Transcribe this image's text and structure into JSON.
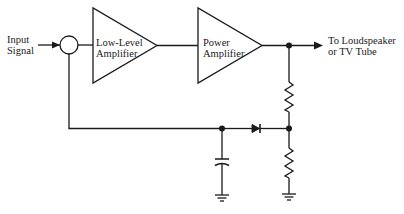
{
  "diagram": {
    "type": "block-schematic",
    "stroke_color": "#1a1a1a",
    "background": "#ffffff",
    "labels": {
      "input_line1": "Input",
      "input_line2": "Signal",
      "low_level_line1": "Low-Level",
      "low_level_line2": "Amplifier",
      "power_line1": "Power",
      "power_line2": "Amplifier",
      "output_line1": "To Loudspeaker",
      "output_line2": "or TV Tube"
    },
    "blocks": [
      {
        "id": "summing-junction",
        "shape": "circle"
      },
      {
        "id": "low-level-amplifier",
        "shape": "triangle",
        "label": "Low-Level Amplifier"
      },
      {
        "id": "power-amplifier",
        "shape": "triangle",
        "label": "Power Amplifier"
      },
      {
        "id": "resistor-upper",
        "shape": "resistor"
      },
      {
        "id": "resistor-lower",
        "shape": "resistor"
      },
      {
        "id": "diode",
        "shape": "diode"
      },
      {
        "id": "capacitor",
        "shape": "capacitor"
      },
      {
        "id": "ground-capacitor",
        "shape": "ground"
      },
      {
        "id": "ground-resistor",
        "shape": "ground"
      }
    ],
    "connections": [
      "Input Signal -> summing-junction",
      "summing-junction -> low-level-amplifier",
      "low-level-amplifier -> power-amplifier",
      "power-amplifier -> output-node -> To Loudspeaker or TV Tube",
      "output-node -> resistor-upper -> divider-node -> resistor-lower -> ground",
      "divider-node -> diode -> cap-node (diode cathode toward divider)",
      "cap-node -> capacitor -> ground",
      "cap-node -> feedback -> summing-junction"
    ]
  }
}
